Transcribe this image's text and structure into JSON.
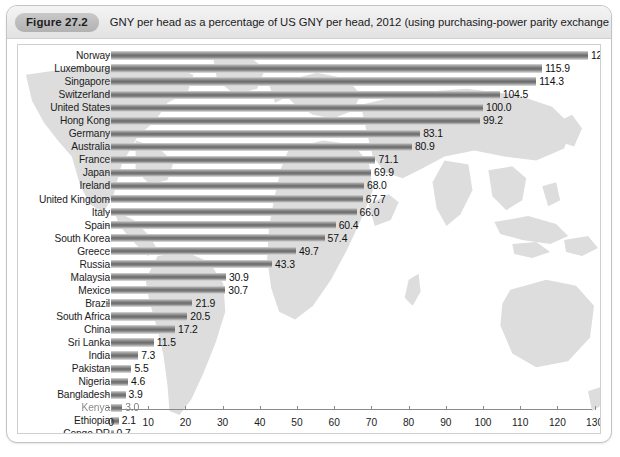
{
  "figure": {
    "badge": "Figure 27.2",
    "title": "GNY per head as a percentage of US GNY per head, 2012 (using purchasing-power parity exchange rates)"
  },
  "chart_data": {
    "type": "bar",
    "orientation": "horizontal",
    "title": "GNY per head as a percentage of US GNY per head, 2012 (using purchasing-power parity exchange rates)",
    "xlabel": "",
    "ylabel": "",
    "xlim": [
      0,
      135
    ],
    "xticks": [
      0,
      10,
      20,
      30,
      40,
      50,
      60,
      70,
      80,
      90,
      100,
      110,
      120,
      130
    ],
    "grid": false,
    "legend": null,
    "categories": [
      "Norway",
      "Luxembourg",
      "Singapore",
      "Switzerland",
      "United States",
      "Hong Kong",
      "Germany",
      "Australia",
      "France",
      "Japan",
      "Ireland",
      "United Kingdom",
      "Italy",
      "Spain",
      "South Korea",
      "Greece",
      "Russia",
      "Malaysia",
      "Mexico",
      "Brazil",
      "South Africa",
      "China",
      "Sri Lanka",
      "India",
      "Pakistan",
      "Nigeria",
      "Bangladesh",
      "Kenya",
      "Ethiopia",
      "Congo DR"
    ],
    "values": [
      128.2,
      115.9,
      114.3,
      104.5,
      100.0,
      99.2,
      83.1,
      80.9,
      71.1,
      69.9,
      68.0,
      67.7,
      66.0,
      60.4,
      57.4,
      49.7,
      43.3,
      30.9,
      30.7,
      21.9,
      20.5,
      17.2,
      11.5,
      7.3,
      5.5,
      4.6,
      3.9,
      3.0,
      2.1,
      0.7
    ],
    "value_labels": [
      "128.2",
      "115.9",
      "114.3",
      "104.5",
      "100.0",
      "99.2",
      "83.1",
      "80.9",
      "71.1",
      "69.9",
      "68.0",
      "67.7",
      "66.0",
      "60.4",
      "57.4",
      "49.7",
      "43.3",
      "30.9",
      "30.7",
      "21.9",
      "20.5",
      "17.2",
      "11.5",
      "7.3",
      "5.5",
      "4.6",
      "3.9",
      "3.0",
      "2.1",
      "0.7"
    ],
    "degraded_rows": [
      27
    ],
    "background_watermark": "world-map"
  },
  "colors": {
    "bar_dark": "#6c6c6c",
    "bar_light": "#d9d9d9",
    "watermark": "#dcdcdc",
    "text": "#1c1c1c",
    "card_border": "#c3c3c3",
    "badge": "#bdbdbd"
  }
}
